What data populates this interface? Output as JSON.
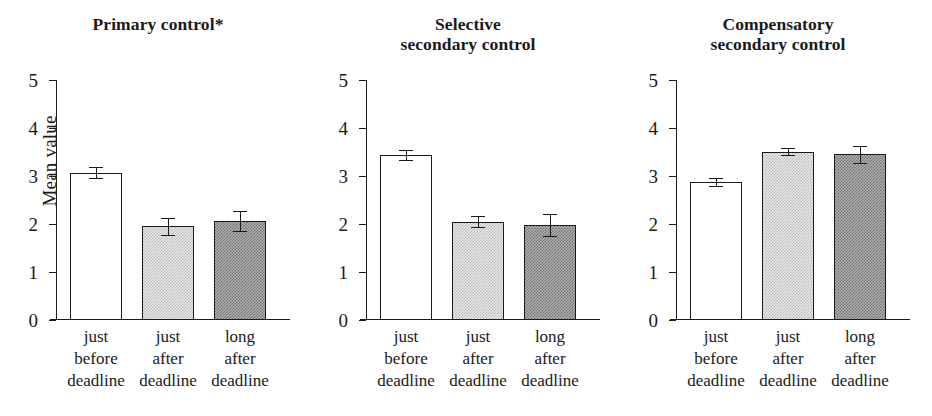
{
  "figure": {
    "ylabel": "Mean value",
    "y_ticks": [
      "0",
      "1",
      "2",
      "3",
      "4",
      "5"
    ],
    "categories": [
      "just before deadline",
      "just after deadline",
      "long after deadline"
    ],
    "category_lines": [
      [
        "just",
        "before",
        "deadline"
      ],
      [
        "just",
        "after",
        "deadline"
      ],
      [
        "long",
        "after",
        "deadline"
      ]
    ],
    "panels": [
      {
        "title_lines": [
          "Primary control*"
        ],
        "title": "Primary control*"
      },
      {
        "title_lines": [
          "Selective",
          "secondary control"
        ],
        "title": "Selective secondary control"
      },
      {
        "title_lines": [
          "Compensatory",
          "secondary control"
        ],
        "title": "Compensatory secondary control"
      }
    ],
    "colors": {
      "axis": "#1a1a1a",
      "bar_white": "#ffffff",
      "bar_light": "#d8d8d8",
      "bar_dark": "#909090"
    }
  },
  "chart_data": {
    "type": "bar",
    "xlabel": "",
    "ylabel": "Mean value",
    "ylim": [
      0,
      5
    ],
    "yticks": [
      0,
      1,
      2,
      3,
      4,
      5
    ],
    "grid": false,
    "legend": "none",
    "error_bars": "standard error",
    "panel_layout": "1x3 side-by-side",
    "categories": [
      "just before deadline",
      "just after deadline",
      "long after deadline"
    ],
    "panels": [
      {
        "title": "Primary control*",
        "significance_marker": "*",
        "values": [
          3.07,
          1.95,
          2.07
        ],
        "errors": [
          0.11,
          0.17,
          0.21
        ],
        "bar_styles": [
          "white",
          "light-gray-stipple",
          "dark-gray-stipple"
        ]
      },
      {
        "title": "Selective secondary control",
        "significance_marker": "",
        "values": [
          3.44,
          2.05,
          1.98
        ],
        "errors": [
          0.1,
          0.11,
          0.23
        ],
        "bar_styles": [
          "white",
          "light-gray-stipple",
          "dark-gray-stipple"
        ]
      },
      {
        "title": "Compensatory secondary control",
        "significance_marker": "",
        "values": [
          2.88,
          3.51,
          3.45
        ],
        "errors": [
          0.08,
          0.07,
          0.17
        ],
        "bar_styles": [
          "white",
          "light-gray-stipple",
          "dark-gray-stipple"
        ]
      }
    ]
  }
}
